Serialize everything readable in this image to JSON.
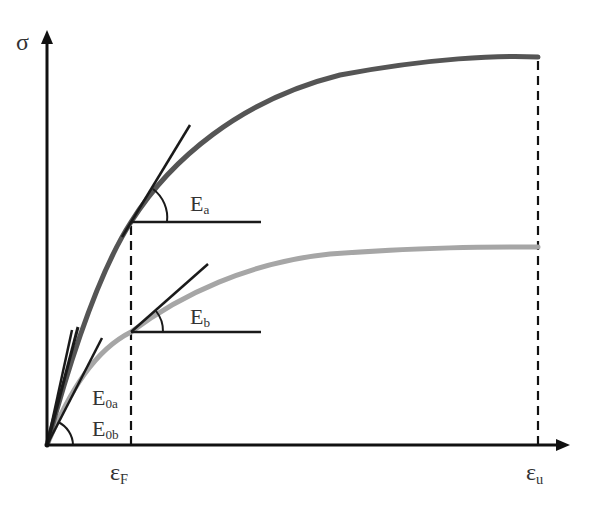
{
  "diagram": {
    "type": "stress-strain curves with tangent moduli",
    "y_axis_label": "σ",
    "x_ticks": [
      {
        "base": "ε",
        "sub": "F"
      },
      {
        "base": "ε",
        "sub": "u"
      }
    ],
    "curves": [
      {
        "name": "curve-a",
        "color": "#555555",
        "description": "upper stress-strain curve (darker)"
      },
      {
        "name": "curve-b",
        "color": "#a6a6a6",
        "description": "lower stress-strain curve (lighter)"
      }
    ],
    "annotations": [
      {
        "base": "E",
        "sub": "a",
        "meaning": "tangent modulus of curve a at εF"
      },
      {
        "base": "E",
        "sub": "b",
        "meaning": "tangent modulus of curve b at εF"
      },
      {
        "base": "E",
        "sub": "0a",
        "meaning": "initial modulus of curve a"
      },
      {
        "base": "E",
        "sub": "0b",
        "meaning": "initial modulus of curve b"
      }
    ],
    "colors": {
      "axis": "#111111",
      "tangent": "#1a1a1a",
      "curve_a": "#555555",
      "curve_b": "#a6a6a6",
      "text": "#333333"
    }
  },
  "labels": {
    "sigma": "σ",
    "eps": "ε",
    "F": "F",
    "u": "u",
    "E": "E",
    "a": "a",
    "b": "b",
    "zero_a": "0a",
    "zero_b": "0b"
  }
}
